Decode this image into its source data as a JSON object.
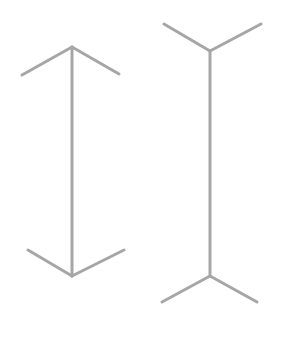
{
  "diagram": {
    "type": "muller-lyer-illusion",
    "stroke_color": "#a6a6a6",
    "stroke_width": 3,
    "background": "#ffffff",
    "figures": [
      {
        "name": "arrowheads-inward",
        "shaft": {
          "x1": 72,
          "y1": 47,
          "x2": 72,
          "y2": 276
        },
        "fins": [
          {
            "x1": 72,
            "y1": 47,
            "x2": 22,
            "y2": 75
          },
          {
            "x1": 72,
            "y1": 47,
            "x2": 119,
            "y2": 74
          },
          {
            "x1": 72,
            "y1": 276,
            "x2": 28,
            "y2": 250
          },
          {
            "x1": 72,
            "y1": 276,
            "x2": 124,
            "y2": 250
          }
        ]
      },
      {
        "name": "arrowheads-outward",
        "shaft": {
          "x1": 210,
          "y1": 51,
          "x2": 210,
          "y2": 276
        },
        "fins": [
          {
            "x1": 210,
            "y1": 51,
            "x2": 164,
            "y2": 24
          },
          {
            "x1": 210,
            "y1": 51,
            "x2": 261,
            "y2": 24
          },
          {
            "x1": 210,
            "y1": 276,
            "x2": 162,
            "y2": 302
          },
          {
            "x1": 210,
            "y1": 276,
            "x2": 257,
            "y2": 302
          }
        ]
      }
    ]
  }
}
